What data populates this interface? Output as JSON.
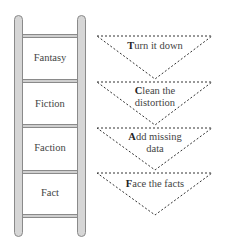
{
  "ladder": {
    "steps": [
      {
        "label": "Fantasy"
      },
      {
        "label": "Fiction"
      },
      {
        "label": "Faction"
      },
      {
        "label": "Fact"
      }
    ]
  },
  "funnels": [
    {
      "initial": "T",
      "rest_line1": "urn it down",
      "line2": ""
    },
    {
      "initial": "C",
      "rest_line1": "lean the",
      "line2": "distortion"
    },
    {
      "initial": "A",
      "rest_line1": "dd missing",
      "line2": "data"
    },
    {
      "initial": "F",
      "rest_line1": "ace the facts",
      "line2": ""
    }
  ],
  "colors": {
    "rail_fill": "#d6d6d6",
    "rail_stroke": "#8a8a8a",
    "dash": "#333333",
    "text": "#444444"
  }
}
